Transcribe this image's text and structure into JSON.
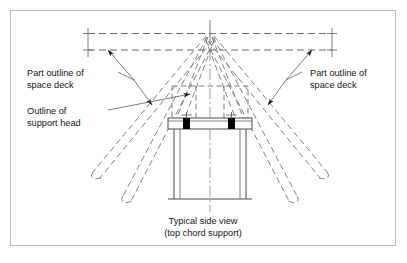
{
  "figure": {
    "title_lines": [
      "Typical side view",
      "(top chord support)"
    ],
    "caption_line_1": "Typical side view",
    "caption_line_2": "(top chord support)",
    "frame_color": "#b9bcc0",
    "line_color": "#4a4a4a",
    "dash_color": "#6d6d6d",
    "bolt_color": "#000000",
    "background": "#ffffff"
  },
  "labels": {
    "left_deck": {
      "line1": "Part outline of",
      "line2": "space deck"
    },
    "right_deck": {
      "line1": "Part outline of",
      "line2": "space deck"
    },
    "support_head": {
      "line1": "Outline of",
      "line2": "support head"
    }
  },
  "parts": {
    "top_chord": "top-chord-dashed-pair",
    "apex_node": "node-apex",
    "web_members": "diagonal-web-members",
    "support_head_outline": "dashed-support-head-box",
    "bearing_plate": "bearing-plate",
    "bolts": [
      "bolt-left",
      "bolt-right"
    ],
    "column": "support-column",
    "base": "column-base-line",
    "centerline": "vertical-centre-line"
  }
}
